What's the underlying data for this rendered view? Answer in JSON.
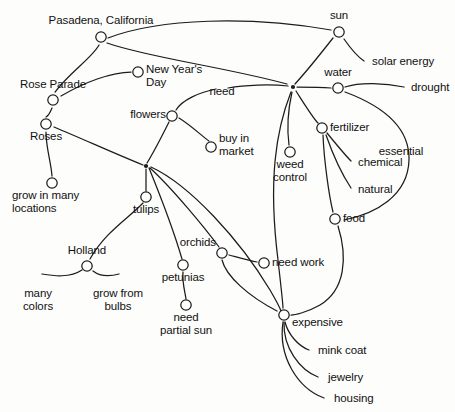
{
  "diagram": {
    "type": "concept-map",
    "title_text": "",
    "stroke_color": "#1c1c1c",
    "node_fill": "#ffffff",
    "background": "#fdfdfc",
    "nodes": [
      {
        "id": "pasadena",
        "label": "Pasadena, California",
        "x": 101,
        "y": 37,
        "lx": 101,
        "ly": 14,
        "align": "c",
        "marker": "circle"
      },
      {
        "id": "sun",
        "label": "sun",
        "x": 339,
        "y": 32,
        "lx": 339,
        "ly": 9,
        "align": "c",
        "marker": "circle"
      },
      {
        "id": "solar",
        "label": "solar energy",
        "x": 366,
        "y": 62,
        "lx": 372,
        "ly": 55,
        "align": "l",
        "marker": "none"
      },
      {
        "id": "newyear",
        "label": "New Year's\nDay",
        "x": 138,
        "y": 72,
        "lx": 146,
        "ly": 63,
        "align": "l",
        "marker": "circle"
      },
      {
        "id": "roseparade",
        "label": "Rose Parade",
        "x": 53,
        "y": 100,
        "lx": 53,
        "ly": 78,
        "align": "c",
        "marker": "circle"
      },
      {
        "id": "water",
        "label": "water",
        "x": 338,
        "y": 88,
        "lx": 338,
        "ly": 66,
        "align": "c",
        "marker": "circle"
      },
      {
        "id": "drought",
        "label": "drought",
        "x": 406,
        "y": 88,
        "lx": 411,
        "ly": 81,
        "align": "l",
        "marker": "none"
      },
      {
        "id": "need",
        "label": "need",
        "x": 222,
        "y": 88,
        "lx": 222,
        "ly": 85,
        "align": "c",
        "marker": "none"
      },
      {
        "id": "flowers",
        "label": "flowers",
        "x": 172,
        "y": 116,
        "lx": 166,
        "ly": 108,
        "align": "r",
        "marker": "circle"
      },
      {
        "id": "roses",
        "label": "Roses",
        "x": 46,
        "y": 124,
        "lx": 46,
        "ly": 130,
        "align": "c",
        "marker": "circle"
      },
      {
        "id": "fertilizer",
        "label": "fertilizer",
        "x": 322,
        "y": 128,
        "lx": 330,
        "ly": 121,
        "align": "l",
        "marker": "circle"
      },
      {
        "id": "buymarket",
        "label": "buy in\nmarket",
        "x": 211,
        "y": 147,
        "lx": 219,
        "ly": 132,
        "align": "l",
        "marker": "circle"
      },
      {
        "id": "essential",
        "label": "essential",
        "x": 408,
        "y": 152,
        "lx": 401,
        "ly": 145,
        "align": "c",
        "marker": "none"
      },
      {
        "id": "weedcontrol",
        "label": "weed\ncontrol",
        "x": 290,
        "y": 152,
        "lx": 290,
        "ly": 158,
        "align": "c",
        "marker": "circle"
      },
      {
        "id": "chemical",
        "label": "chemical",
        "x": 353,
        "y": 163,
        "lx": 358,
        "ly": 156,
        "align": "l",
        "marker": "none"
      },
      {
        "id": "growmany",
        "label": "grow in many\nlocations",
        "x": 52,
        "y": 183,
        "lx": 12,
        "ly": 189,
        "align": "l",
        "marker": "circle"
      },
      {
        "id": "natural",
        "label": "natural",
        "x": 353,
        "y": 190,
        "lx": 358,
        "ly": 183,
        "align": "l",
        "marker": "none"
      },
      {
        "id": "tulips",
        "label": "tulips",
        "x": 146,
        "y": 197,
        "lx": 146,
        "ly": 203,
        "align": "c",
        "marker": "circle"
      },
      {
        "id": "food",
        "label": "food",
        "x": 335,
        "y": 219,
        "lx": 343,
        "ly": 212,
        "align": "l",
        "marker": "circle"
      },
      {
        "id": "orchids",
        "label": "orchids",
        "x": 222,
        "y": 253,
        "lx": 216,
        "ly": 236,
        "align": "r",
        "marker": "circle"
      },
      {
        "id": "needwork",
        "label": "need work",
        "x": 264,
        "y": 263,
        "lx": 272,
        "ly": 256,
        "align": "l",
        "marker": "circle"
      },
      {
        "id": "holland",
        "label": "Holland",
        "x": 87,
        "y": 266,
        "lx": 87,
        "ly": 244,
        "align": "c",
        "marker": "circle"
      },
      {
        "id": "petunias",
        "label": "petunias",
        "x": 183,
        "y": 265,
        "lx": 183,
        "ly": 271,
        "align": "c",
        "marker": "circle"
      },
      {
        "id": "manycolors",
        "label": "many\ncolors",
        "x": 38,
        "y": 286,
        "lx": 38,
        "ly": 287,
        "align": "c",
        "marker": "none"
      },
      {
        "id": "growbulbs",
        "label": "grow from\nbulbs",
        "x": 118,
        "y": 286,
        "lx": 118,
        "ly": 287,
        "align": "c",
        "marker": "none"
      },
      {
        "id": "needsun",
        "label": "need\npartial sun",
        "x": 186,
        "y": 305,
        "lx": 186,
        "ly": 311,
        "align": "c",
        "marker": "circle"
      },
      {
        "id": "expensive",
        "label": "expensive",
        "x": 284,
        "y": 315,
        "lx": 292,
        "ly": 316,
        "align": "l",
        "marker": "circle"
      },
      {
        "id": "minkcoat",
        "label": "mink coat",
        "x": 312,
        "y": 351,
        "lx": 318,
        "ly": 344,
        "align": "l",
        "marker": "none"
      },
      {
        "id": "jewelry",
        "label": "jewelry",
        "x": 322,
        "y": 378,
        "lx": 328,
        "ly": 371,
        "align": "l",
        "marker": "none"
      },
      {
        "id": "housing",
        "label": "housing",
        "x": 328,
        "y": 399,
        "lx": 334,
        "ly": 392,
        "align": "l",
        "marker": "none"
      }
    ],
    "hubs": [
      {
        "id": "hub-left",
        "x": 146,
        "y": 166
      },
      {
        "id": "hub-right",
        "x": 293,
        "y": 87
      }
    ],
    "edges": [
      {
        "from": "pasadena",
        "to": "roseparade",
        "d": "M 99,45 C 92,58 70,72 55,92"
      },
      {
        "from": "pasadena",
        "to": "sun",
        "d": "M 108,38 C 160,18 250,16 331,30"
      },
      {
        "from": "pasadena",
        "to": "hub-right",
        "d": "M 107,43 C 150,58 220,66 287,84"
      },
      {
        "from": "roseparade",
        "to": "newyear",
        "d": "M 61,96 C 85,82 112,72 131,72"
      },
      {
        "from": "roseparade",
        "to": "roses",
        "d": "M 52,108 C 50,113 48,116 46,117"
      },
      {
        "from": "roses",
        "to": "hub-left",
        "d": "M 54,127 C 85,140 118,155 143,165"
      },
      {
        "from": "roses",
        "to": "growmany",
        "d": "M 46,132 C 46,148 51,162 52,176"
      },
      {
        "from": "sun",
        "to": "solar",
        "d": "M 344,39 C 351,49 358,57 364,61"
      },
      {
        "from": "sun",
        "to": "hub-right",
        "d": "M 333,38 C 322,52 306,72 295,84"
      },
      {
        "from": "water",
        "to": "hub-right",
        "d": "M 331,88 C 320,87 306,87 297,87"
      },
      {
        "from": "water",
        "to": "drought",
        "d": "M 345,87 C 360,82 385,83 404,87"
      },
      {
        "from": "water",
        "to": "essentialcurve",
        "d": "M 345,92 C 380,105 410,125 409,160 C 408,196 375,214 344,220"
      },
      {
        "from": "hub-right",
        "to": "need",
        "d": "M 288,86 C 270,84 245,85 228,88"
      },
      {
        "from": "hub-right",
        "to": "weedcontrol",
        "d": "M 292,92 C 288,110 287,130 289,145"
      },
      {
        "from": "hub-right",
        "to": "fertilizer",
        "d": "M 296,91 C 305,105 313,118 318,123"
      },
      {
        "from": "hub-right",
        "to": "foodcurve",
        "d": "M 291,92 C 276,130 268,180 278,260 C 282,295 283,305 283,308"
      },
      {
        "from": "fertilizer",
        "to": "chemical",
        "d": "M 327,133 C 336,144 345,155 351,161"
      },
      {
        "from": "fertilizer",
        "to": "natural",
        "d": "M 326,135 C 333,155 343,176 351,188"
      },
      {
        "from": "fertilizer",
        "to": "food",
        "d": "M 323,135 C 324,160 329,196 333,212"
      },
      {
        "from": "need",
        "to": "flowers",
        "d": "M 216,89 C 200,92 182,100 176,110"
      },
      {
        "from": "flowers",
        "to": "buymarket",
        "d": "M 179,118 C 192,126 204,138 209,141"
      },
      {
        "from": "flowers",
        "to": "hub-left",
        "d": "M 169,122 C 162,136 152,155 147,163"
      },
      {
        "from": "hub-left",
        "to": "tulips",
        "d": "M 146,169 C 146,177 146,186 146,191"
      },
      {
        "from": "hub-left",
        "to": "petunias",
        "d": "M 149,168 C 160,195 175,235 182,259"
      },
      {
        "from": "hub-left",
        "to": "orchids",
        "d": "M 150,168 C 172,188 205,228 219,247"
      },
      {
        "from": "hub-left",
        "to": "expensivelong",
        "d": "M 151,167 C 190,185 240,240 270,290 C 277,302 280,308 281,311"
      },
      {
        "from": "tulips",
        "to": "holland",
        "d": "M 143,203 C 130,217 105,232 90,259"
      },
      {
        "from": "holland",
        "to": "manycolors",
        "d": "M 82,270 C 70,278 54,276 42,274"
      },
      {
        "from": "holland",
        "to": "growbulbs",
        "d": "M 93,271 C 102,278 112,276 119,274"
      },
      {
        "from": "petunias",
        "to": "needsun",
        "d": "M 183,272 C 182,282 185,292 186,299"
      },
      {
        "from": "orchids",
        "to": "needwork",
        "d": "M 229,255 C 240,258 250,261 257,262"
      },
      {
        "from": "orchids",
        "to": "expensive",
        "d": "M 222,260 C 226,276 248,296 277,311"
      },
      {
        "from": "food",
        "to": "expensive",
        "d": "M 338,226 C 348,258 345,290 320,305 C 306,313 294,315 291,315"
      },
      {
        "from": "expensive",
        "to": "minkcoat",
        "d": "M 285,322 C 288,334 298,346 309,350"
      },
      {
        "from": "expensive",
        "to": "jewelry",
        "d": "M 284,322 C 283,348 300,370 318,377"
      },
      {
        "from": "expensive",
        "to": "housing",
        "d": "M 283,322 C 278,356 297,388 324,398"
      }
    ]
  }
}
